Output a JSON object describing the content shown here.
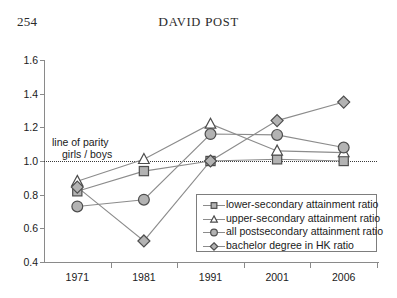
{
  "page": {
    "folio": "254",
    "running_title_first": "D",
    "running_title_rest": "AVID ",
    "running_title_second": "P",
    "running_title_rest2": "OST"
  },
  "chart_data": {
    "type": "line",
    "title": "",
    "xlabel": "",
    "ylabel": "",
    "categories": [
      "1971",
      "1981",
      "1991",
      "2001",
      "2006"
    ],
    "ylim": [
      0.4,
      1.6
    ],
    "ytick_labels": [
      "0.4",
      "0.6",
      "0.8",
      "1.0",
      "1.2",
      "1.4",
      "1.6"
    ],
    "ytick_values": [
      0.4,
      0.6,
      0.8,
      1.0,
      1.2,
      1.4,
      1.6
    ],
    "grid": false,
    "legend_position": "inside-lower-right",
    "annotations": [
      {
        "name": "line-of-parity",
        "line1": "line of parity",
        "line2": "girls / boys",
        "value": 1.0,
        "style": "dotted"
      }
    ],
    "series": [
      {
        "name": "lower-secondary attainment ratio",
        "marker": "square",
        "values": [
          0.82,
          0.94,
          1.0,
          1.01,
          1.0
        ]
      },
      {
        "name": "upper-secondary attainment ratio",
        "marker": "triangle",
        "values": [
          0.88,
          1.01,
          1.22,
          1.06,
          1.05
        ]
      },
      {
        "name": "all postsecondary attainment ratio",
        "marker": "circle",
        "values": [
          0.73,
          0.77,
          1.16,
          1.155,
          1.08
        ]
      },
      {
        "name": "bachelor degree in HK ratio",
        "marker": "diamond",
        "values": [
          0.845,
          0.525,
          1.0,
          1.24,
          1.35
        ]
      }
    ],
    "colors": {
      "marker_fill": "#b3b3b3",
      "marker_stroke": "#4d4d4d",
      "line": "#8c8c8c",
      "axis": "#8a8a8a",
      "text": "#1a1a1a",
      "parity": "#3a3a3a",
      "background": "#ffffff"
    }
  }
}
